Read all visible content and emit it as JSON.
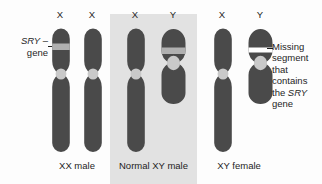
{
  "figure": {
    "colors": {
      "chromosome_body": "#4a4a4a",
      "sry_band": "#b0b0b0",
      "missing_band": "#ffffff",
      "centromere": "#c9c9c9",
      "panel_highlight": "#e2e2e2",
      "background": "#fdfdfd",
      "text": "#1d1d1d"
    }
  },
  "annotations": {
    "sry_gene_label": {
      "line1_italic": "SRY",
      "line1_dash": " –",
      "line2": "gene"
    },
    "missing_segment_callout": {
      "dash": "–",
      "line1": "Missing",
      "line2": "segment",
      "line3": "that",
      "line4": "contains",
      "line5_prefix": "the ",
      "line5_italic": "SRY",
      "line6": "gene"
    }
  },
  "groups": [
    {
      "id": "xx-male",
      "label": "XX male",
      "highlighted": false,
      "chromosomes": [
        {
          "id": "xx-male-x1",
          "top_label": "X",
          "type": "X",
          "band": "sry",
          "band_color": "#b0b0b0"
        },
        {
          "id": "xx-male-x2",
          "top_label": "X",
          "type": "X",
          "band": "none",
          "band_color": null
        }
      ]
    },
    {
      "id": "normal-xy-male",
      "label": "Normal XY male",
      "highlighted": true,
      "chromosomes": [
        {
          "id": "normal-xy-x",
          "top_label": "X",
          "type": "X",
          "band": "none",
          "band_color": null
        },
        {
          "id": "normal-xy-y",
          "top_label": "Y",
          "type": "Y",
          "band": "sry",
          "band_color": "#b0b0b0"
        }
      ]
    },
    {
      "id": "xy-female",
      "label": "XY female",
      "highlighted": false,
      "chromosomes": [
        {
          "id": "xy-female-x",
          "top_label": "X",
          "type": "X",
          "band": "none",
          "band_color": null
        },
        {
          "id": "xy-female-y",
          "top_label": "Y",
          "type": "Y",
          "band": "missing",
          "band_color": "#ffffff"
        }
      ]
    }
  ]
}
